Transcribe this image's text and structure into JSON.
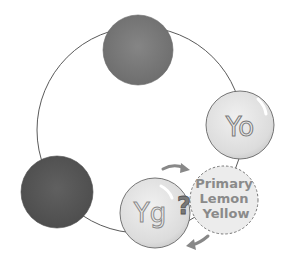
{
  "diagram": {
    "type": "color-wheel-illustration",
    "colors": {
      "ring": "#5a5a5a",
      "dark_circle_top": "#7a7a7a",
      "dark_circle_left": "#585858",
      "light_circle": "#e2e2e2",
      "dashed_circle": "#ececec",
      "text": "#8a8a8a",
      "arrow": "#8a8a8a"
    },
    "nodes": [
      {
        "id": "top",
        "label": ""
      },
      {
        "id": "left",
        "label": ""
      },
      {
        "id": "yo",
        "label": "Yo"
      },
      {
        "id": "yg",
        "label": "Yg"
      }
    ],
    "question_mark": "?",
    "callout": {
      "line1": "Primary",
      "line2": "Lemon",
      "line3": "Yellow"
    }
  }
}
